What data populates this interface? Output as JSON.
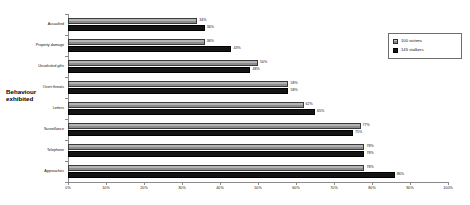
{
  "chart_data": {
    "type": "bar",
    "orientation": "horizontal",
    "title": "",
    "xlabel": "",
    "ylabel": "Behaviour exhibited",
    "xlim": [
      0,
      100
    ],
    "grid": false,
    "legend_position": "right",
    "xticks": [
      "0%",
      "10%",
      "20%",
      "30%",
      "40%",
      "50%",
      "60%",
      "70%",
      "80%",
      "90%",
      "100%"
    ],
    "categories": [
      "Assaulted",
      "Property damage",
      "Unsolicited gifts",
      "Overt threats",
      "Letters",
      "Surveillance",
      "Telephone",
      "Approaches"
    ],
    "series": [
      {
        "name": "100 victims",
        "color": "#b4b4b4",
        "values": [
          34,
          36,
          50,
          58,
          62,
          77,
          78,
          78
        ],
        "labels": [
          "34%",
          "36%",
          "50%",
          "58%",
          "62%",
          "77%",
          "78%",
          "78%"
        ]
      },
      {
        "name": "145 stalkers",
        "color": "#141414",
        "values": [
          36,
          43,
          48,
          58,
          65,
          75,
          78,
          86
        ],
        "labels": [
          "36%",
          "43%",
          "48%",
          "58%",
          "65%",
          "75%",
          "78%",
          "86%"
        ]
      }
    ]
  },
  "axis_title": {
    "line1": "Behaviour",
    "line2": "exhibited"
  },
  "legend": {
    "entries": [
      {
        "label": "100 victims"
      },
      {
        "label": "145 stalkers"
      }
    ]
  }
}
